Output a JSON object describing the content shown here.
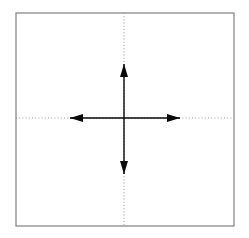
{
  "figure": {
    "canvas": {
      "width": 249,
      "height": 238,
      "background": "#ffffff"
    },
    "square": {
      "label": "bounding-square",
      "x": 16,
      "y": 13,
      "width": 218,
      "height": 213,
      "stroke": "#808080",
      "stroke_width": 1.2,
      "fill": "none"
    },
    "center": {
      "x": 124,
      "y": 118
    },
    "dotted_axes": {
      "stroke": "#9a9a9a",
      "stroke_width": 1.1,
      "dash_pattern": "1,2.2",
      "horizontal": {
        "label": "horizontal-dotted-axis",
        "x1": 16,
        "y1": 118,
        "x2": 234,
        "y2": 118
      },
      "vertical": {
        "label": "vertical-dotted-axis",
        "x1": 124,
        "y1": 13,
        "x2": 124,
        "y2": 226
      }
    },
    "solid_arrows": {
      "stroke": "#0a0a0a",
      "stroke_width": 1.4,
      "head_width": 8,
      "head_length": 13,
      "horizontal": {
        "label": "horizontal-double-arrow",
        "x1": 70,
        "y1": 118,
        "x2": 180,
        "y2": 118,
        "heads": [
          "left",
          "right"
        ]
      },
      "vertical": {
        "label": "vertical-double-arrow",
        "x1": 124,
        "y1": 64,
        "x2": 124,
        "y2": 174,
        "heads": [
          "up",
          "down"
        ]
      }
    },
    "arrow_heads": [
      {
        "name": "arrow-head-up",
        "tip_x": 124,
        "tip_y": 64,
        "direction": "up"
      },
      {
        "name": "arrow-head-down",
        "tip_x": 124,
        "tip_y": 174,
        "direction": "down"
      },
      {
        "name": "arrow-head-left",
        "tip_x": 70,
        "tip_y": 118,
        "direction": "left"
      },
      {
        "name": "arrow-head-right",
        "tip_x": 180,
        "tip_y": 118,
        "direction": "right"
      }
    ]
  }
}
